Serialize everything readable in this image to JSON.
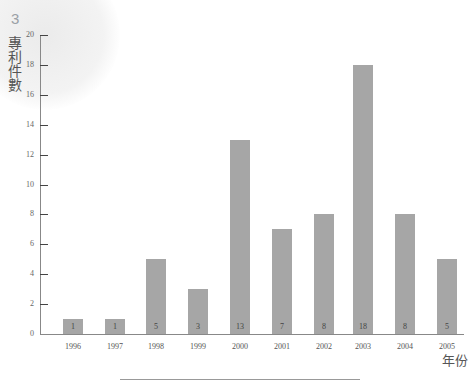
{
  "page": {
    "chapter_number": "3"
  },
  "chart_data": {
    "type": "bar",
    "title": "",
    "xlabel": "年份",
    "ylabel": "專利件數",
    "categories": [
      "1996",
      "1997",
      "1998",
      "1999",
      "2000",
      "2001",
      "2002",
      "2003",
      "2004",
      "2005"
    ],
    "values": [
      1,
      1,
      5,
      3,
      13,
      7,
      8,
      18,
      8,
      5
    ],
    "ylim": [
      0,
      20
    ],
    "yticks": [
      0,
      2,
      4,
      6,
      8,
      10,
      12,
      14,
      16,
      18,
      20
    ],
    "grid": false,
    "legend": null,
    "bar_color": "#a6a6a6",
    "data_labels": [
      "1",
      "1",
      "5",
      "3",
      "13",
      "7",
      "8",
      "18",
      "8",
      "5"
    ]
  }
}
